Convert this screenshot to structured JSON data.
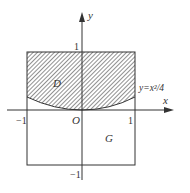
{
  "figure": {
    "axes": {
      "x_label": "x",
      "y_label": "y",
      "origin_label": "O"
    },
    "ticks": {
      "x_neg": "−1",
      "x_pos": "1",
      "y_pos": "1",
      "y_neg": "−1"
    },
    "regions": {
      "shaded_label": "D",
      "square_label": "G"
    },
    "curve": {
      "label": "y=x²/4",
      "equation": "y = x^2/4"
    },
    "colors": {
      "line": "#333333",
      "hatch": "#555555",
      "background": "#ffffff"
    }
  }
}
